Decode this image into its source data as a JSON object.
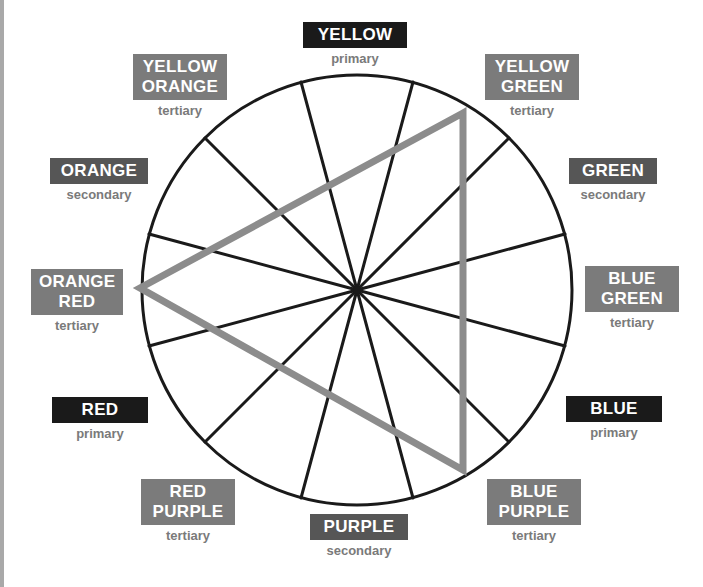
{
  "diagram": {
    "type": "color-wheel-triad",
    "colors": {
      "primary_box": "#1a1a1a",
      "secondary_box": "#565656",
      "tertiary_box": "#7b7b7b",
      "category_text": "#7a7a7a",
      "triangle": "#8c8c8c",
      "wheel_lines": "#1a1a1a"
    },
    "segments": 12,
    "triangle_vertices": [
      "YELLOW GREEN",
      "ORANGE RED",
      "BLUE PURPLE"
    ]
  },
  "labels": {
    "yellow": {
      "lines": [
        "YELLOW"
      ],
      "category": "primary"
    },
    "yellow_green": {
      "lines": [
        "YELLOW",
        "GREEN"
      ],
      "category": "tertiary"
    },
    "green": {
      "lines": [
        "GREEN"
      ],
      "category": "secondary"
    },
    "blue_green": {
      "lines": [
        "BLUE",
        "GREEN"
      ],
      "category": "tertiary"
    },
    "blue": {
      "lines": [
        "BLUE"
      ],
      "category": "primary"
    },
    "blue_purple": {
      "lines": [
        "BLUE",
        "PURPLE"
      ],
      "category": "tertiary"
    },
    "purple": {
      "lines": [
        "PURPLE"
      ],
      "category": "secondary"
    },
    "red_purple": {
      "lines": [
        "RED",
        "PURPLE"
      ],
      "category": "tertiary"
    },
    "red": {
      "lines": [
        "RED"
      ],
      "category": "primary"
    },
    "orange_red": {
      "lines": [
        "ORANGE",
        "RED"
      ],
      "category": "tertiary"
    },
    "orange": {
      "lines": [
        "ORANGE"
      ],
      "category": "secondary"
    },
    "yellow_orange": {
      "lines": [
        "YELLOW",
        "ORANGE"
      ],
      "category": "tertiary"
    }
  }
}
